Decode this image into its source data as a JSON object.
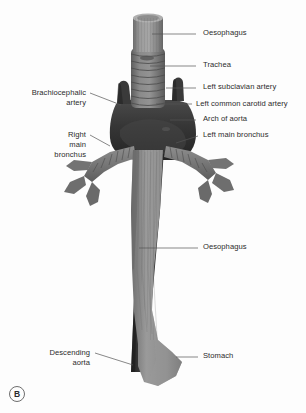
{
  "figure": {
    "panel_letter": "B",
    "background_color": "#fdfdfd",
    "label_color": "#2b2b2b",
    "leader_line_color": "#555555"
  },
  "palette": {
    "oesophagus": "#8d8d8d",
    "oesophagus_shade": "#6f6f6f",
    "oesophagus_light": "#a0a0a0",
    "trachea": "#7b7b7b",
    "trachea_ring": "#606060",
    "bronchus": "#767676",
    "aorta_dark": "#2e2e2e",
    "aorta_mid": "#3c3c3c",
    "arch_branch": "#343434",
    "stomach": "#8a8a8a"
  },
  "labels": [
    {
      "id": "oesophagus-top",
      "name": "label-oesophagus-upper",
      "text": "Oesophagus",
      "side": "right",
      "x": 203,
      "y": 28,
      "leader": {
        "x1": 196,
        "y1": 34,
        "x2": 152,
        "y2": 34
      }
    },
    {
      "id": "trachea",
      "name": "label-trachea",
      "text": "Trachea",
      "side": "right",
      "x": 203,
      "y": 60,
      "leader": {
        "x1": 196,
        "y1": 66,
        "x2": 150,
        "y2": 66
      }
    },
    {
      "id": "left-subclavian-artery",
      "name": "label-left-subclavian-artery",
      "text": "Left subclavian artery",
      "side": "right",
      "x": 203,
      "y": 82,
      "leader": {
        "x1": 196,
        "y1": 88,
        "x2": 166,
        "y2": 88
      }
    },
    {
      "id": "left-common-carotid-artery",
      "name": "label-left-common-carotid-artery",
      "text": "Left common carotid artery",
      "side": "right",
      "x": 196,
      "y": 99,
      "leader": {
        "x1": 192,
        "y1": 104,
        "x2": 156,
        "y2": 104
      }
    },
    {
      "id": "arch-of-aorta",
      "name": "label-arch-of-aorta",
      "text": "Arch of aorta",
      "side": "right",
      "x": 203,
      "y": 114,
      "leader": {
        "x1": 196,
        "y1": 120,
        "x2": 170,
        "y2": 120
      }
    },
    {
      "id": "left-main-bronchus",
      "name": "label-left-main-bronchus",
      "text": "Left main bronchus",
      "side": "right",
      "x": 203,
      "y": 130,
      "leader": {
        "x1": 198,
        "y1": 136,
        "x2": 176,
        "y2": 143
      }
    },
    {
      "id": "oesophagus-lower",
      "name": "label-oesophagus-lower",
      "text": "Oesophagus",
      "side": "right",
      "x": 203,
      "y": 242,
      "leader": {
        "x1": 198,
        "y1": 248,
        "x2": 139,
        "y2": 248
      }
    },
    {
      "id": "stomach",
      "name": "label-stomach",
      "text": "Stomach",
      "side": "right",
      "x": 203,
      "y": 351,
      "leader": {
        "x1": 198,
        "y1": 357,
        "x2": 176,
        "y2": 357
      }
    },
    {
      "id": "brachiocephalic-artery",
      "name": "label-brachiocephalic-artery",
      "text": "Brachiocephalic\nartery",
      "side": "left",
      "x": 14,
      "y": 88,
      "width": 72,
      "leader": {
        "x1": 90,
        "y1": 93,
        "x2": 121,
        "y2": 105
      }
    },
    {
      "id": "right-main-bronchus",
      "name": "label-right-main-bronchus",
      "text": "Right\nmain\nbronchus",
      "side": "left",
      "x": 20,
      "y": 130,
      "width": 66,
      "leader": {
        "x1": 90,
        "y1": 135,
        "x2": 110,
        "y2": 146
      }
    },
    {
      "id": "descending-aorta",
      "name": "label-descending-aorta",
      "text": "Descending\naorta",
      "side": "left",
      "x": 22,
      "y": 348,
      "width": 68,
      "leader": {
        "x1": 95,
        "y1": 353,
        "x2": 133,
        "y2": 365
      }
    }
  ]
}
